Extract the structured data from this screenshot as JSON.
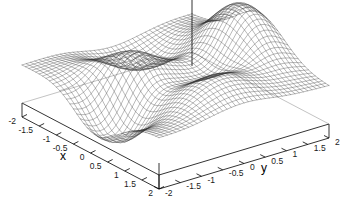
{
  "chart_data": {
    "type": "surface",
    "title": "",
    "xlabel": "x",
    "ylabel": "y",
    "zlabel": "",
    "xlim": [
      -2,
      2
    ],
    "ylim": [
      -2,
      2
    ],
    "zlim": [
      -6,
      8
    ],
    "grid": true,
    "legend": "none",
    "style": "wireframe-mesh",
    "projection": "gnuplot-3d",
    "view": {
      "rot_x": 60,
      "rot_z": 30,
      "scale": 1.0
    },
    "xticks": [
      -2,
      -1.5,
      -1,
      -0.5,
      0,
      0.5,
      1,
      1.5,
      2
    ],
    "xticklabels": [
      "-2",
      "-1.5",
      "-1",
      "-0.5",
      "0",
      "0.5",
      "1",
      "1.5",
      "2"
    ],
    "yticks": [
      -2,
      -1.5,
      -1,
      -0.5,
      0,
      0.5,
      1,
      1.5,
      2
    ],
    "yticklabels": [
      "-2",
      "-1.5",
      "-1",
      "-0.5",
      "0",
      "0.5",
      "1",
      "1.5",
      "2"
    ],
    "mesh": {
      "nx": 41,
      "ny": 41
    },
    "function": "peaks",
    "function_expr": "3*(1-x)^2*exp(-x^2-(y+1)^2) - 10*(x/5 - x^3 - y^5)*exp(-x^2-y^2) - (1/3)*exp(-(x+1)^2-y^2)",
    "surface_color": "#303030",
    "axis_color": "#000000",
    "background": "#ffffff"
  },
  "axes": {
    "x_label": "x",
    "y_label": "y",
    "x_tick_labels": [
      "-2",
      "-1.5",
      "-1",
      "-0.5",
      "0",
      "0.5",
      "1",
      "1.5",
      "2"
    ],
    "y_tick_labels": [
      "-2",
      "-1.5",
      "-1",
      "-0.5",
      "0",
      "0.5",
      "1",
      "1.5",
      "2"
    ]
  },
  "colors": {
    "surface": "#303030",
    "axis": "#000000",
    "background": "#ffffff",
    "text": "#111111"
  }
}
